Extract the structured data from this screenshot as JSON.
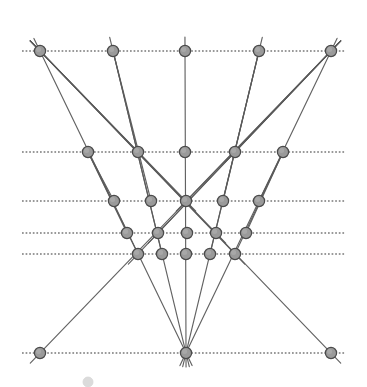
{
  "figure": {
    "width": 367,
    "height": 387,
    "background_color": "#ffffff",
    "node_fill_color": "#9a9a9a",
    "node_stroke_color": "#4a4a4a",
    "pencil_line_color": "#5a5a5a",
    "dotted_line_color": "#6d6d6d",
    "node_radius": 5.6
  },
  "chart_data": {
    "type": "scatter",
    "xlabel": "",
    "ylabel": "",
    "xlim": [
      0,
      367
    ],
    "ylim": [
      387,
      0
    ],
    "grid": false,
    "legend": "none",
    "rows": [
      {
        "id": "row-1",
        "y": 51,
        "x_start": 22,
        "x_end": 346,
        "node_x": [
          40,
          113,
          185,
          259,
          331
        ]
      },
      {
        "id": "row-2",
        "y": 152,
        "x_start": 22,
        "x_end": 346,
        "node_x": [
          88,
          138,
          185,
          235,
          283
        ]
      },
      {
        "id": "row-3",
        "y": 201,
        "x_start": 22,
        "x_end": 346,
        "node_x": [
          114,
          151,
          186,
          223,
          259
        ]
      },
      {
        "id": "row-4",
        "y": 233,
        "x_start": 22,
        "x_end": 346,
        "node_x": [
          127,
          158,
          187,
          216,
          246
        ]
      },
      {
        "id": "row-5",
        "y": 254,
        "x_start": 22,
        "x_end": 346,
        "node_x": [
          138,
          162,
          186,
          210,
          235
        ]
      },
      {
        "id": "row-6",
        "y": 353,
        "x_start": 22,
        "x_end": 346,
        "node_x": [
          40,
          186,
          331
        ]
      }
    ],
    "apex": {
      "x": 186,
      "y": 353,
      "label": "bottom-center-convergence-point"
    },
    "pencils": [
      {
        "name": "pencil-from-apex",
        "from": [
          186,
          353
        ],
        "through": [
          [
            40,
            51
          ],
          [
            113,
            51
          ],
          [
            185,
            51
          ],
          [
            259,
            51
          ],
          [
            331,
            51
          ]
        ],
        "extend_beyond": 14
      },
      {
        "name": "pencil-from-top-left",
        "from": [
          40,
          51
        ],
        "through": [
          [
            138,
            152
          ],
          [
            186,
            201
          ],
          [
            216,
            233
          ],
          [
            235,
            254
          ],
          [
            331,
            353
          ]
        ],
        "extend_beyond": 14
      },
      {
        "name": "pencil-from-top-right",
        "from": [
          331,
          51
        ],
        "through": [
          [
            235,
            152
          ],
          [
            186,
            201
          ],
          [
            158,
            233
          ],
          [
            138,
            254
          ],
          [
            40,
            353
          ]
        ],
        "extend_beyond": 14
      },
      {
        "name": "pencil-from-top-inner-left",
        "from": [
          113,
          51
        ],
        "through": [
          [
            151,
            201
          ],
          [
            162,
            254
          ]
        ],
        "extend_beyond": 0
      },
      {
        "name": "pencil-from-top-inner-right",
        "from": [
          259,
          51
        ],
        "through": [
          [
            223,
            201
          ],
          [
            210,
            254
          ]
        ],
        "extend_beyond": 0
      },
      {
        "name": "edge-left-mid-chain",
        "from": [
          88,
          152
        ],
        "through": [
          [
            114,
            201
          ],
          [
            127,
            233
          ],
          [
            138,
            254
          ]
        ],
        "extend_beyond": 0
      },
      {
        "name": "edge-right-mid-chain",
        "from": [
          283,
          152
        ],
        "through": [
          [
            259,
            201
          ],
          [
            246,
            233
          ],
          [
            235,
            254
          ]
        ],
        "extend_beyond": 0
      }
    ],
    "node_count": 28,
    "row_count": 6
  },
  "nodes": [
    {
      "row": 1,
      "index": 0,
      "x": 40,
      "y": 51,
      "name": "node-r1-c1"
    },
    {
      "row": 1,
      "index": 1,
      "x": 113,
      "y": 51,
      "name": "node-r1-c2"
    },
    {
      "row": 1,
      "index": 2,
      "x": 185,
      "y": 51,
      "name": "node-r1-c3"
    },
    {
      "row": 1,
      "index": 3,
      "x": 259,
      "y": 51,
      "name": "node-r1-c4"
    },
    {
      "row": 1,
      "index": 4,
      "x": 331,
      "y": 51,
      "name": "node-r1-c5"
    },
    {
      "row": 2,
      "index": 0,
      "x": 88,
      "y": 152,
      "name": "node-r2-c1"
    },
    {
      "row": 2,
      "index": 1,
      "x": 138,
      "y": 152,
      "name": "node-r2-c2"
    },
    {
      "row": 2,
      "index": 2,
      "x": 185,
      "y": 152,
      "name": "node-r2-c3"
    },
    {
      "row": 2,
      "index": 3,
      "x": 235,
      "y": 152,
      "name": "node-r2-c4"
    },
    {
      "row": 2,
      "index": 4,
      "x": 283,
      "y": 152,
      "name": "node-r2-c5"
    },
    {
      "row": 3,
      "index": 0,
      "x": 114,
      "y": 201,
      "name": "node-r3-c1"
    },
    {
      "row": 3,
      "index": 1,
      "x": 151,
      "y": 201,
      "name": "node-r3-c2"
    },
    {
      "row": 3,
      "index": 2,
      "x": 186,
      "y": 201,
      "name": "node-r3-c3"
    },
    {
      "row": 3,
      "index": 3,
      "x": 223,
      "y": 201,
      "name": "node-r3-c4"
    },
    {
      "row": 3,
      "index": 4,
      "x": 259,
      "y": 201,
      "name": "node-r3-c5"
    },
    {
      "row": 4,
      "index": 0,
      "x": 127,
      "y": 233,
      "name": "node-r4-c1"
    },
    {
      "row": 4,
      "index": 1,
      "x": 158,
      "y": 233,
      "name": "node-r4-c2"
    },
    {
      "row": 4,
      "index": 2,
      "x": 187,
      "y": 233,
      "name": "node-r4-c3"
    },
    {
      "row": 4,
      "index": 3,
      "x": 216,
      "y": 233,
      "name": "node-r4-c4"
    },
    {
      "row": 4,
      "index": 4,
      "x": 246,
      "y": 233,
      "name": "node-r4-c5"
    },
    {
      "row": 5,
      "index": 0,
      "x": 138,
      "y": 254,
      "name": "node-r5-c1"
    },
    {
      "row": 5,
      "index": 1,
      "x": 162,
      "y": 254,
      "name": "node-r5-c2"
    },
    {
      "row": 5,
      "index": 2,
      "x": 186,
      "y": 254,
      "name": "node-r5-c3"
    },
    {
      "row": 5,
      "index": 3,
      "x": 210,
      "y": 254,
      "name": "node-r5-c4"
    },
    {
      "row": 5,
      "index": 4,
      "x": 235,
      "y": 254,
      "name": "node-r5-c5"
    },
    {
      "row": 6,
      "index": 0,
      "x": 40,
      "y": 353,
      "name": "node-r6-c1"
    },
    {
      "row": 6,
      "index": 1,
      "x": 186,
      "y": 353,
      "name": "node-r6-c2"
    },
    {
      "row": 6,
      "index": 2,
      "x": 331,
      "y": 353,
      "name": "node-r6-c3"
    }
  ],
  "caption_ghost": {
    "x": 88,
    "y": 382,
    "r": 5.0,
    "name": "cropped-caption-marker"
  }
}
